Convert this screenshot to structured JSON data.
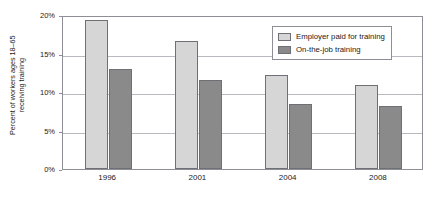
{
  "chart_data": {
    "type": "bar",
    "title": "",
    "subtitle": "",
    "xlabel": "",
    "ylabel_line1": "Percent of workers ages 18–65",
    "ylabel_line2": "receiving training",
    "categories": [
      "1996",
      "2001",
      "2004",
      "2008"
    ],
    "series": [
      {
        "name": "Employer paid for training",
        "color": "#d6d6d6",
        "values": [
          19.3,
          16.6,
          12.2,
          10.9
        ]
      },
      {
        "name": "On-the-job training",
        "color": "#8a8a8a",
        "values": [
          13.0,
          11.5,
          8.4,
          8.2
        ]
      }
    ],
    "ylim": [
      0,
      20
    ],
    "ytick_values": [
      0,
      5,
      10,
      15,
      20
    ],
    "ytick_labels": [
      "0%",
      "5%",
      "10%",
      "15%",
      "20%"
    ],
    "grid": true,
    "grid_axis": "y",
    "legend_position": "top-right",
    "plot_border": true,
    "bar_edge_color": "#6f6f76",
    "gridline_color": "#b9b9c0",
    "axis_color": "#8e8e96",
    "background": "#ffffff"
  },
  "legend": {
    "items": [
      {
        "label": "Employer paid for training",
        "swatch": "light"
      },
      {
        "label": "On-the-job training",
        "swatch": "dark"
      }
    ]
  }
}
